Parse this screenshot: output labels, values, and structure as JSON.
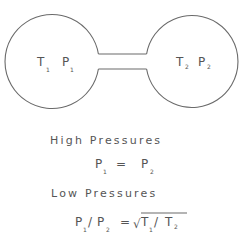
{
  "diagram": {
    "colors": {
      "line": "#6a6a6a",
      "text": "#555555",
      "background": "#ffffff"
    },
    "left_vessel": {
      "temperature": {
        "symbol": "T",
        "subscript": "1"
      },
      "pressure": {
        "symbol": "P",
        "subscript": "1"
      }
    },
    "right_vessel": {
      "temperature": {
        "symbol": "T",
        "subscript": "2"
      },
      "pressure": {
        "symbol": "P",
        "subscript": "2"
      }
    },
    "high_pressure": {
      "heading": "High Pressures",
      "equation": {
        "lhs": {
          "symbol": "P",
          "subscript": "1"
        },
        "operator": "=",
        "rhs": {
          "symbol": "P",
          "subscript": "2"
        }
      }
    },
    "low_pressure": {
      "heading": "Low Pressures",
      "equation": {
        "lhs_num": {
          "symbol": "P",
          "subscript": "1"
        },
        "lhs_slash": "/",
        "lhs_den": {
          "symbol": "P",
          "subscript": "2"
        },
        "operator": "=",
        "sqrt_symbol": "√",
        "rhs_num": {
          "symbol": "T",
          "subscript": "1"
        },
        "rhs_slash": "/",
        "rhs_den": {
          "symbol": "T",
          "subscript": "2"
        }
      }
    }
  }
}
